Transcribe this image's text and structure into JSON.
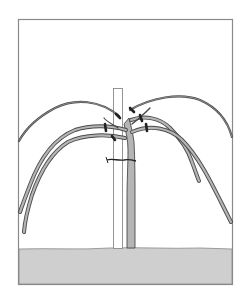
{
  "figure": {
    "colors": {
      "background": "#ffffff",
      "frame": "#8a8a8a",
      "ground": "#cfcfcf",
      "ground_edge": "#888888",
      "vine_fill": "#b5b5b5",
      "vine_outline": "#4a4a4a",
      "ties": "#222222",
      "stake_outline": "#8a8a8a"
    },
    "elements": {
      "frame": "frame",
      "ground": "soil",
      "stake": "support-stake",
      "trunk": "vine-trunk",
      "canes": "arching-canes",
      "ties": "cane-ties"
    }
  },
  "caption": {
    "text": ""
  }
}
